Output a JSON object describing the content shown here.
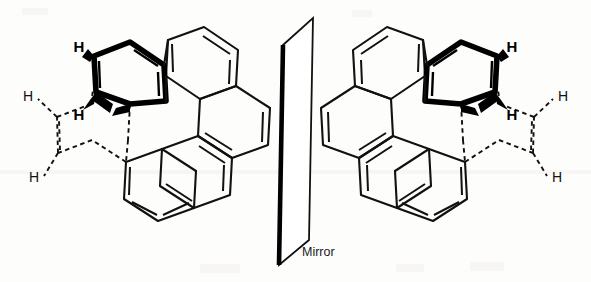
{
  "figure": {
    "kind": "chemical-structure-diagram",
    "background_color": "#fdfdfc",
    "line_color": "#111111",
    "bold_bond_color": "#000000"
  },
  "mirror": {
    "label": "Mirror",
    "label_x": 302,
    "label_y": 253,
    "description": "vertical reflective plane drawn in perspective as a slanted parallelogram"
  },
  "left_molecule": {
    "name": "left-enantiomer",
    "hydrogen_labels": [
      {
        "id": "h-top",
        "text": "H",
        "weight": "bold",
        "x": 79,
        "y": 48
      },
      {
        "id": "h-upper-outer",
        "text": "H",
        "weight": "thin",
        "x": 28,
        "y": 97
      },
      {
        "id": "h-inner",
        "text": "H",
        "weight": "bold",
        "x": 79,
        "y": 116
      },
      {
        "id": "h-lower-outer",
        "text": "H",
        "weight": "thin",
        "x": 34,
        "y": 178
      }
    ],
    "bold_ring_note": "terminal aromatic ring drawn with heavy bonds to indicate it lies in front",
    "dashed_ring_note": "terminal aromatic ring drawn dashed to indicate it lies behind"
  },
  "right_molecule": {
    "name": "right-enantiomer",
    "hydrogen_labels": [
      {
        "id": "h-top",
        "text": "H",
        "weight": "bold",
        "x": 512,
        "y": 48
      },
      {
        "id": "h-upper-outer",
        "text": "H",
        "weight": "thin",
        "x": 563,
        "y": 97
      },
      {
        "id": "h-inner",
        "text": "H",
        "weight": "bold",
        "x": 512,
        "y": 116
      },
      {
        "id": "h-lower-outer",
        "text": "H",
        "weight": "thin",
        "x": 557,
        "y": 178
      }
    ],
    "bold_ring_note": "terminal aromatic ring drawn with heavy bonds to indicate it lies in front",
    "dashed_ring_note": "terminal aromatic ring drawn dashed to indicate it lies behind"
  }
}
